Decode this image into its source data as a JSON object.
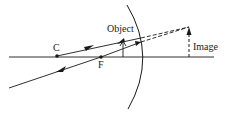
{
  "diagram": {
    "type": "concave-mirror-ray-diagram",
    "labels": {
      "center_of_curvature": "C",
      "focal_point": "F",
      "object": "Object",
      "image": "Image"
    },
    "colors": {
      "ink": "#1a1a1a",
      "background": "#ffffff"
    }
  }
}
